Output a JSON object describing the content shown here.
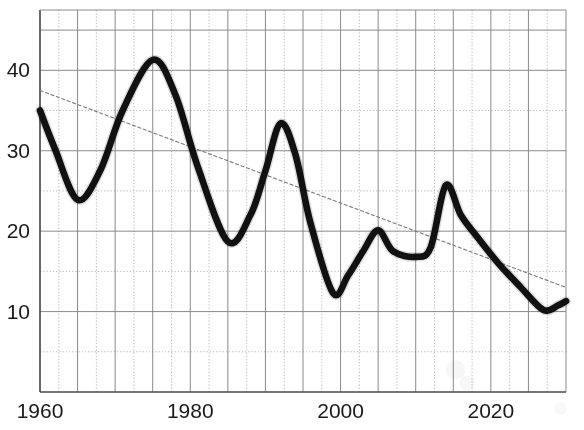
{
  "chart_data": {
    "type": "line",
    "title": "",
    "subtitle": "",
    "xlabel": "",
    "ylabel": "",
    "xlim": [
      1960,
      2030
    ],
    "ylim": [
      0,
      47.5
    ],
    "grid": true,
    "legend": "none",
    "x_ticks": [
      1960,
      1980,
      2000,
      2020
    ],
    "x_tick_labels": [
      "1960",
      "1980",
      "2000",
      "2020"
    ],
    "x_gridlines_major": [
      1960,
      1965,
      1970,
      1975,
      1980,
      1985,
      1990,
      1995,
      2000,
      2005,
      2010,
      2015,
      2020,
      2025,
      2030
    ],
    "x_gridlines_minor": [
      1962.5,
      1967.5,
      1972.5,
      1977.5,
      1982.5,
      1987.5,
      1992.5,
      1997.5,
      2002.5,
      2007.5,
      2012.5,
      2017.5,
      2022.5,
      2027.5
    ],
    "y_ticks": [
      10,
      20,
      30,
      40
    ],
    "y_tick_labels": [
      "10",
      "20",
      "30",
      "40"
    ],
    "y_gridlines_major": [
      10,
      20,
      30,
      40,
      45
    ],
    "y_gridlines_minor": [
      5,
      15,
      25,
      35
    ],
    "series": [
      {
        "name": "main-series",
        "style": "solid-thick",
        "color": "#111111",
        "x": [
          1960,
          1962,
          1965,
          1968,
          1971,
          1975,
          1978,
          1981,
          1985,
          1988,
          1990,
          1992,
          1994,
          1996,
          1999,
          2001,
          2003,
          2005,
          2007,
          2010,
          2012,
          2014,
          2016,
          2018,
          2021,
          2024,
          2027,
          2029,
          2030
        ],
        "values": [
          35.0,
          30.2,
          23.9,
          27.5,
          35.0,
          41.3,
          37.0,
          28.0,
          18.7,
          22.0,
          27.5,
          33.4,
          29.5,
          21.0,
          12.3,
          14.5,
          17.5,
          20.1,
          17.5,
          16.8,
          18.0,
          25.7,
          22.0,
          19.5,
          16.0,
          13.0,
          10.2,
          10.8,
          11.3
        ]
      },
      {
        "name": "trend-line",
        "style": "dotted-thin",
        "color": "#7a7a7a",
        "x": [
          1960,
          2030
        ],
        "values": [
          37.5,
          13.0
        ]
      }
    ],
    "annotations": []
  },
  "colors": {
    "background": "#ffffff",
    "axis": "#4a4a4a",
    "grid_major": "#8a8a8a",
    "grid_minor": "#b8b8b8",
    "series_main": "#111111",
    "trend": "#7a7a7a",
    "tick_text": "#1a1a1a"
  }
}
